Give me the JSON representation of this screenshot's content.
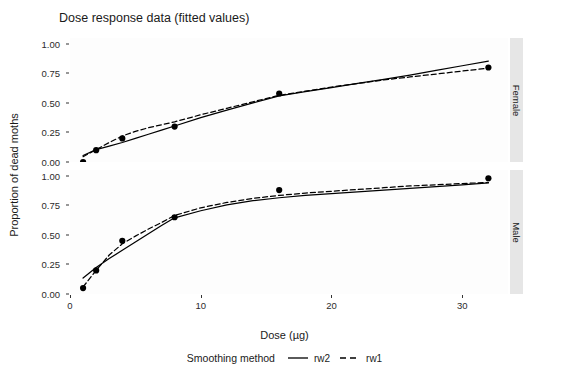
{
  "chart_data": {
    "type": "line",
    "title": "Dose response data (fitted values)",
    "xlabel": "Dose (µg)",
    "ylabel": "Proportion of dead moths",
    "xlim": [
      0,
      33.5
    ],
    "ylim": [
      0.0,
      1.05
    ],
    "grid": false,
    "legend_position": "bottom",
    "legend_title": "Smoothing method",
    "xticks": [
      0,
      10,
      20,
      30
    ],
    "xtick_labels": [
      "0",
      "10",
      "20",
      "30"
    ],
    "yticks": [
      0.0,
      0.25,
      0.5,
      0.75,
      1.0
    ],
    "ytick_labels": [
      "0.00",
      "0.25",
      "0.50",
      "0.75",
      "1.00"
    ],
    "facets": [
      {
        "label": "Female",
        "points": {
          "x": [
            1,
            2,
            4,
            8,
            16,
            32
          ],
          "y": [
            0.0,
            0.1,
            0.2,
            0.3,
            0.58,
            0.8
          ]
        },
        "series": [
          {
            "name": "rw2",
            "style": "solid",
            "color": "#000000",
            "x": [
              1,
              2,
              3,
              4,
              5,
              6,
              7,
              8,
              10,
              12,
              14,
              16,
              18,
              20,
              22,
              24,
              26,
              28,
              30,
              32
            ],
            "y": [
              0.055,
              0.105,
              0.135,
              0.165,
              0.2,
              0.235,
              0.27,
              0.305,
              0.375,
              0.44,
              0.5,
              0.56,
              0.595,
              0.63,
              0.665,
              0.7,
              0.735,
              0.775,
              0.815,
              0.855
            ]
          },
          {
            "name": "rw1",
            "style": "dashed",
            "color": "#000000",
            "x": [
              1,
              2,
              3,
              4,
              5,
              6,
              7,
              8,
              10,
              12,
              14,
              16,
              18,
              20,
              22,
              24,
              26,
              28,
              30,
              32
            ],
            "y": [
              0.045,
              0.105,
              0.165,
              0.22,
              0.26,
              0.29,
              0.315,
              0.34,
              0.4,
              0.455,
              0.51,
              0.565,
              0.6,
              0.635,
              0.665,
              0.695,
              0.72,
              0.745,
              0.77,
              0.795
            ]
          }
        ]
      },
      {
        "label": "Male",
        "points": {
          "x": [
            1,
            2,
            4,
            8,
            16,
            32
          ],
          "y": [
            0.05,
            0.2,
            0.45,
            0.65,
            0.88,
            0.98
          ]
        },
        "series": [
          {
            "name": "rw2",
            "style": "solid",
            "color": "#000000",
            "x": [
              1,
              2,
              3,
              4,
              5,
              6,
              7,
              8,
              10,
              12,
              14,
              16,
              18,
              20,
              22,
              24,
              26,
              28,
              30,
              32
            ],
            "y": [
              0.135,
              0.225,
              0.3,
              0.37,
              0.44,
              0.51,
              0.58,
              0.645,
              0.705,
              0.755,
              0.79,
              0.815,
              0.835,
              0.85,
              0.865,
              0.88,
              0.895,
              0.91,
              0.925,
              0.94
            ]
          },
          {
            "name": "rw1",
            "style": "dashed",
            "color": "#000000",
            "x": [
              1,
              2,
              3,
              4,
              5,
              6,
              7,
              8,
              10,
              12,
              14,
              16,
              18,
              20,
              22,
              24,
              26,
              28,
              30,
              32
            ],
            "y": [
              0.06,
              0.2,
              0.33,
              0.425,
              0.49,
              0.55,
              0.605,
              0.665,
              0.73,
              0.775,
              0.81,
              0.835,
              0.855,
              0.87,
              0.885,
              0.9,
              0.915,
              0.925,
              0.935,
              0.945
            ]
          }
        ]
      }
    ],
    "legend_entries": [
      {
        "label": "rw2",
        "style": "solid"
      },
      {
        "label": "rw1",
        "style": "dashed"
      }
    ]
  },
  "colors": {
    "line": "#000000",
    "point": "#000000",
    "panel_bg": "#fdfdfd",
    "strip_bg": "#e6e6e6",
    "text": "#1a1a1a"
  }
}
